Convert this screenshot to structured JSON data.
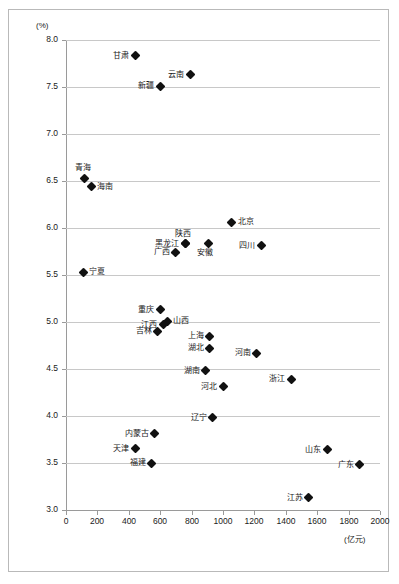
{
  "chart_data": {
    "type": "scatter",
    "title": "",
    "xlabel": "(亿元)",
    "ylabel": "(%)",
    "xlim": [
      0,
      2000
    ],
    "ylim": [
      3.0,
      8.0
    ],
    "grid": true,
    "legend": "none",
    "xticks": [
      "0",
      "200",
      "400",
      "600",
      "800",
      "1000",
      "1200",
      "1400",
      "1600",
      "1800",
      "2000"
    ],
    "yticks": [
      "3.0",
      "3.5",
      "4.0",
      "4.5",
      "5.0",
      "5.5",
      "6.0",
      "6.5",
      "7.0",
      "7.5",
      "8.0"
    ],
    "points": [
      {
        "label": "甘肃",
        "x": 440,
        "y": 7.83,
        "pos": "left"
      },
      {
        "label": "云南",
        "x": 790,
        "y": 7.63,
        "pos": "left"
      },
      {
        "label": "新疆",
        "x": 600,
        "y": 7.51,
        "pos": "left"
      },
      {
        "label": "青海",
        "x": 120,
        "y": 6.53,
        "pos": "top"
      },
      {
        "label": "海南",
        "x": 160,
        "y": 6.44,
        "pos": "right"
      },
      {
        "label": "北京",
        "x": 1055,
        "y": 6.06,
        "pos": "right"
      },
      {
        "label": "陕西",
        "x": 760,
        "y": 5.83,
        "pos": "top"
      },
      {
        "label": "黑龙江",
        "x": 760,
        "y": 5.83,
        "pos": "left"
      },
      {
        "label": "安徽",
        "x": 905,
        "y": 5.83,
        "pos": "bottom"
      },
      {
        "label": "四川",
        "x": 1245,
        "y": 5.81,
        "pos": "left"
      },
      {
        "label": "广西",
        "x": 700,
        "y": 5.74,
        "pos": "left"
      },
      {
        "label": "宁夏",
        "x": 110,
        "y": 5.53,
        "pos": "right"
      },
      {
        "label": "重庆",
        "x": 600,
        "y": 5.13,
        "pos": "left"
      },
      {
        "label": "山西",
        "x": 645,
        "y": 5.01,
        "pos": "right"
      },
      {
        "label": "江西",
        "x": 620,
        "y": 4.97,
        "pos": "left"
      },
      {
        "label": "吉林",
        "x": 585,
        "y": 4.9,
        "pos": "left"
      },
      {
        "label": "上海",
        "x": 915,
        "y": 4.85,
        "pos": "left"
      },
      {
        "label": "湖北",
        "x": 915,
        "y": 4.72,
        "pos": "left"
      },
      {
        "label": "河南",
        "x": 1215,
        "y": 4.67,
        "pos": "left"
      },
      {
        "label": "湖南",
        "x": 890,
        "y": 4.48,
        "pos": "left"
      },
      {
        "label": "浙江",
        "x": 1435,
        "y": 4.39,
        "pos": "left"
      },
      {
        "label": "河北",
        "x": 1000,
        "y": 4.31,
        "pos": "left"
      },
      {
        "label": "辽宁",
        "x": 935,
        "y": 3.98,
        "pos": "left"
      },
      {
        "label": "内蒙古",
        "x": 565,
        "y": 3.81,
        "pos": "left"
      },
      {
        "label": "天津",
        "x": 440,
        "y": 3.65,
        "pos": "left"
      },
      {
        "label": "山东",
        "x": 1665,
        "y": 3.64,
        "pos": "left"
      },
      {
        "label": "广东",
        "x": 1870,
        "y": 3.48,
        "pos": "left"
      },
      {
        "label": "福建",
        "x": 545,
        "y": 3.5,
        "pos": "left"
      },
      {
        "label": "江苏",
        "x": 1545,
        "y": 3.13,
        "pos": "left"
      }
    ]
  }
}
